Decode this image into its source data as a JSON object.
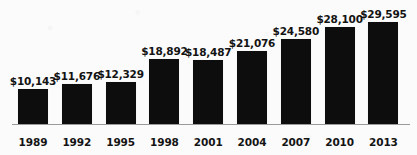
{
  "chart_data": {
    "type": "bar",
    "title": "",
    "subtitle": "",
    "xlabel": "",
    "ylabel": "",
    "categories": [
      "1989",
      "1992",
      "1995",
      "1998",
      "2001",
      "2004",
      "2007",
      "2010",
      "2013"
    ],
    "values": [
      10143,
      11676,
      12329,
      18892,
      18487,
      21076,
      24580,
      28100,
      29595
    ],
    "value_labels": [
      "$10,143",
      "$11,676",
      "$12,329",
      "$18,892",
      "$18,487",
      "$21,076",
      "$24,580",
      "$28,100",
      "$29,595"
    ],
    "series": [
      {
        "name": "",
        "values": [
          10143,
          11676,
          12329,
          18892,
          18487,
          21076,
          24580,
          28100,
          29595
        ]
      }
    ],
    "ylim": [
      0,
      29595
    ],
    "grid": false,
    "legend": false,
    "legend_position": "none",
    "bar_color": "#0d0d0d",
    "axis_color": "#9a9a9a",
    "background_color": "#fbfbfb",
    "label_color": "#131313",
    "annotations": []
  }
}
